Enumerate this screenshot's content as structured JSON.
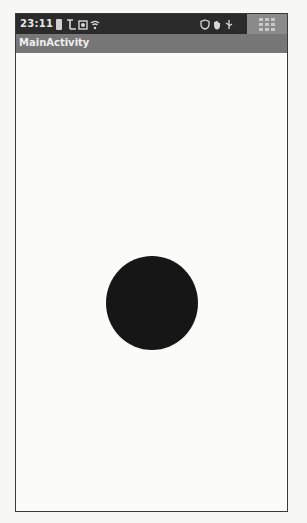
{
  "status_bar": {
    "time": "23:11",
    "left_icons": [
      "battery-icon",
      "signal-icon",
      "photo-icon",
      "wifi-icon"
    ],
    "right_icons": [
      "shield-icon",
      "hand-icon",
      "usb-icon",
      "grid-icon"
    ]
  },
  "title_bar": {
    "title": "MainActivity"
  },
  "content": {
    "shape": "circle",
    "circle_color": "#161616"
  }
}
